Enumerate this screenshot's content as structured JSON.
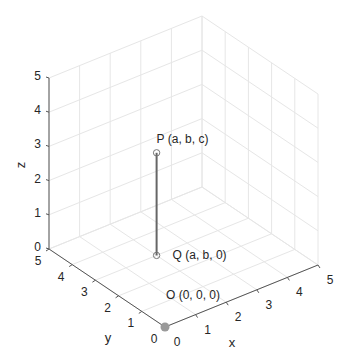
{
  "chart_data": {
    "type": "scatter3d",
    "title": "",
    "xlabel": "x",
    "ylabel": "y",
    "zlabel": "z",
    "xlim": [
      0,
      5
    ],
    "ylim": [
      0,
      5
    ],
    "zlim": [
      0,
      5
    ],
    "xticks": [
      "0",
      "1",
      "2",
      "3",
      "4",
      "5"
    ],
    "yticks": [
      "0",
      "1",
      "2",
      "3",
      "4",
      "5"
    ],
    "zticks": [
      "0",
      "1",
      "2",
      "3",
      "4",
      "5"
    ],
    "grid": true,
    "view": "3D isometric-like (MATLAB default)",
    "points": [
      {
        "name": "P",
        "label": "P (a, b, c)",
        "x": 2,
        "y": 3,
        "z": 3,
        "marker": "open-circle"
      },
      {
        "name": "Q",
        "label": "Q (a, b, 0)",
        "x": 2,
        "y": 3,
        "z": 0,
        "marker": "open-circle"
      },
      {
        "name": "O",
        "label": "O (0, 0, 0)",
        "x": 0,
        "y": 0,
        "z": 0,
        "marker": "filled-circle"
      }
    ],
    "segments": [
      {
        "from": "P",
        "to": "Q",
        "color": "#666666"
      }
    ]
  },
  "colors": {
    "grid": "#e6e6e6",
    "axis": "#555555",
    "line": "#666666",
    "marker_fill_origin": "#9a9a9a",
    "text": "#262626"
  }
}
